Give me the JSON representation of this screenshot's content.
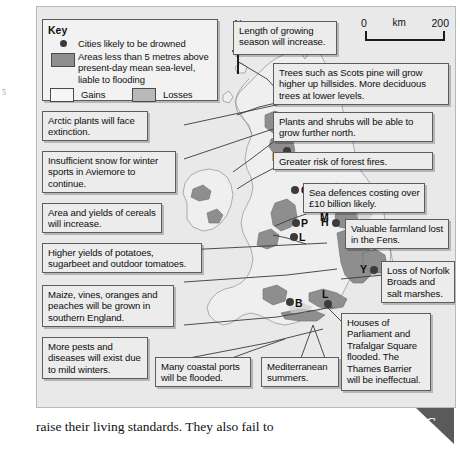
{
  "figure": {
    "key": {
      "title": "Key",
      "entries": [
        {
          "symbol": "city-dot",
          "text": "Cities likely to be drowned"
        },
        {
          "symbol": "flood-swatch",
          "text": "Areas less than 5 metres above present-day mean sea-level, liable to flooding"
        }
      ],
      "gains_label": "Gains",
      "losses_label": "Losses"
    },
    "north_arrow": {
      "label": "N"
    },
    "scale_bar": {
      "zero": "0",
      "unit": "km",
      "max": "200"
    },
    "cities": [
      {
        "code": "E",
        "x": 246,
        "y": 140
      },
      {
        "code": "C",
        "x": 254,
        "y": 179
      },
      {
        "code": "M",
        "x": 284,
        "y": 197
      },
      {
        "code": "P",
        "x": 255,
        "y": 212
      },
      {
        "code": "H",
        "x": 295,
        "y": 212
      },
      {
        "code": "L",
        "x": 253,
        "y": 226
      },
      {
        "code": "Y",
        "x": 333,
        "y": 259
      },
      {
        "code": "B",
        "x": 249,
        "y": 291
      },
      {
        "code": "L",
        "x": 287,
        "y": 293
      }
    ],
    "callouts": [
      {
        "id": "growing-season",
        "text": "Length of growing season will increase."
      },
      {
        "id": "scots-pine",
        "text": "Trees such as Scots pine will grow higher up hillsides. More deciduous trees at lower levels."
      },
      {
        "id": "plants-shrubs",
        "text": "Plants and shrubs will be able to grow further north."
      },
      {
        "id": "forest-fires",
        "text": "Greater risk of forest fires."
      },
      {
        "id": "sea-defences",
        "text": "Sea defences costing over £10 billion likely."
      },
      {
        "id": "farmland-fens",
        "text": "Valuable farmland lost in the Fens."
      },
      {
        "id": "norfolk-broads",
        "text": "Loss of Norfolk Broads and salt marshes."
      },
      {
        "id": "houses-parliament",
        "text": "Houses of Parliament and Trafalgar Square flooded. The Thames Barrier will be ineffectual."
      },
      {
        "id": "arctic-plants",
        "text": "Arctic plants will face extinction."
      },
      {
        "id": "aviemore-snow",
        "text": "Insufficient snow for winter sports in Aviemore to continue."
      },
      {
        "id": "cereals",
        "text": "Area and yields of cereals will increase."
      },
      {
        "id": "potatoes",
        "text": "Higher yields of potatoes, sugarbeet and outdoor tomatoes."
      },
      {
        "id": "maize-vines",
        "text": "Maize, vines, oranges and peaches will be grown in southern England."
      },
      {
        "id": "pests-diseases",
        "text": "More pests and diseases will exist due to mild winters."
      },
      {
        "id": "coastal-ports",
        "text": "Many coastal ports will be flooded."
      },
      {
        "id": "mediterranean",
        "text": "Mediterranean summers."
      }
    ]
  },
  "caption": {
    "text": "raise their living standards. They also fail to"
  },
  "corner_tab": {
    "label": "C"
  },
  "margin_mark": {
    "text": "5"
  },
  "colors": {
    "flood_fill": "#8e8e8e",
    "land_fill": "#efefef",
    "background": "#e9e9e9",
    "callout_bg": "#ececec",
    "outline": "#5d5d5d"
  }
}
